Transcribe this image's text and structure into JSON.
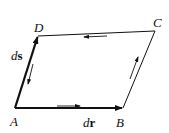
{
  "diagram": {
    "title": "",
    "vertices": [
      {
        "id": "A",
        "label": "A",
        "x": 15,
        "y": 108
      },
      {
        "id": "B",
        "label": "B",
        "x": 123,
        "y": 108
      },
      {
        "id": "C",
        "label": "C",
        "x": 155,
        "y": 31
      },
      {
        "id": "D",
        "label": "D",
        "x": 38,
        "y": 36
      }
    ],
    "edges": [
      {
        "from": "A",
        "to": "B",
        "vector": true,
        "label": "dr",
        "label_parts": {
          "d": "d",
          "v": "r"
        }
      },
      {
        "from": "B",
        "to": "C",
        "vector": false
      },
      {
        "from": "C",
        "to": "D",
        "vector": false
      },
      {
        "from": "A",
        "to": "D",
        "vector": true,
        "label": "ds",
        "label_parts": {
          "d": "d",
          "v": "s"
        }
      }
    ],
    "circulation_arrows": [
      {
        "edge": "A-B",
        "direction": "A→B"
      },
      {
        "edge": "B-C",
        "direction": "B→C"
      },
      {
        "edge": "C-D",
        "direction": "C→D"
      },
      {
        "edge": "D-A",
        "direction": "D→A"
      }
    ],
    "colors": {
      "line": "#111111",
      "background": "#ffffff"
    }
  }
}
